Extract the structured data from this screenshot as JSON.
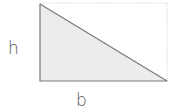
{
  "diagram": {
    "type": "right-triangle-in-rectangle",
    "labels": {
      "height": "h",
      "base": "b"
    },
    "colors": {
      "triangle_fill": "#ececec",
      "stroke": "#7a7a7a",
      "dotted_outline": "#c8c8c8",
      "label": "#555555"
    }
  }
}
